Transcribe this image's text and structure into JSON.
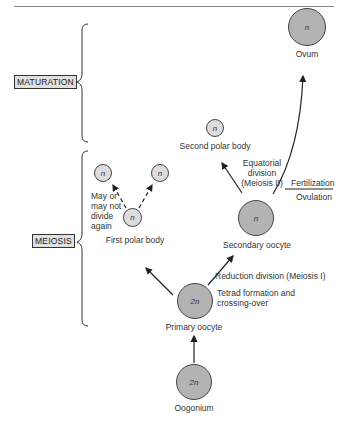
{
  "stages": {
    "maturation": "MATURATION",
    "meiosis": "MEIOSIS"
  },
  "cells": {
    "ovum": {
      "ploidy": "n",
      "label": "Ovum"
    },
    "second_polar_body": {
      "ploidy": "n",
      "label": "Second polar body"
    },
    "first_polar_body": {
      "ploidy": "n",
      "label": "First polar body"
    },
    "first_polar_body_div_left": {
      "ploidy": "n"
    },
    "first_polar_body_div_right": {
      "ploidy": "n"
    },
    "secondary_oocyte": {
      "ploidy": "n",
      "label": "Secondary oocyte"
    },
    "primary_oocyte": {
      "ploidy": "2n",
      "label": "Primary oocyte"
    },
    "oogonium": {
      "ploidy": "2n",
      "label": "Oogonium"
    }
  },
  "annotations": {
    "may_not_divide": [
      "May or",
      "may not",
      "divide",
      "again"
    ],
    "equatorial": [
      "Equatorial",
      "division",
      "(Meiosis II)"
    ],
    "fertilization": "Fertilization",
    "ovulation": "Ovulation",
    "reduction": "Reduction division (Meiosis I)",
    "tetrad": [
      "Tetrad formation and",
      "crossing-over"
    ]
  },
  "colors": {
    "large_cell_fill": "#b3b3b3",
    "small_cell_fill": "#dcdcdc",
    "stroke": "#444444",
    "stage_box_fill": "#e0e0e0"
  }
}
